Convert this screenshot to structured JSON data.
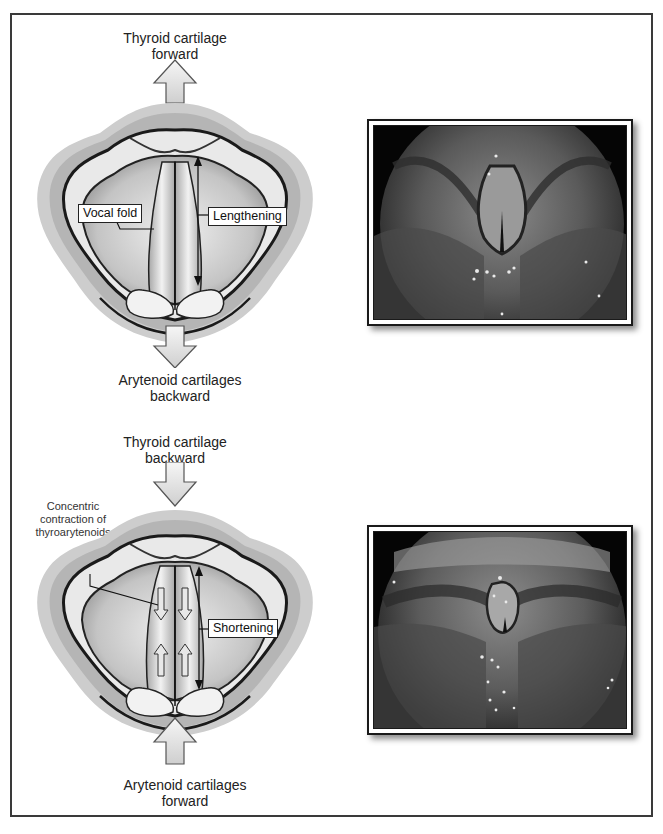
{
  "figure": {
    "panels": [
      {
        "id": "lengthening",
        "top_caption": [
          "Thyroid cartilage",
          "forward"
        ],
        "bottom_caption": [
          "Arytenoid cartilages",
          "backward"
        ],
        "labels": {
          "fold": "Vocal fold",
          "action": "Lengthening"
        },
        "top_arrow": "up",
        "bottom_arrow": "down",
        "photo": "laryngoscopic-view-lengthened-vocal-folds"
      },
      {
        "id": "shortening",
        "top_caption": [
          "Thyroid cartilage",
          "backward"
        ],
        "bottom_caption": [
          "Arytenoid cartilages",
          "forward"
        ],
        "labels": {
          "contraction": [
            "Concentric",
            "contraction of",
            "thyroarytenoids"
          ],
          "action": "Shortening"
        },
        "top_arrow": "down",
        "bottom_arrow": "up",
        "photo": "laryngoscopic-view-shortened-vocal-folds"
      }
    ]
  },
  "colors": {
    "frame": "#3a3a3a",
    "arrow_fill": "#dcdcdc",
    "tissue_outer": "#c8c8c8",
    "photo_bg": "#050505"
  }
}
